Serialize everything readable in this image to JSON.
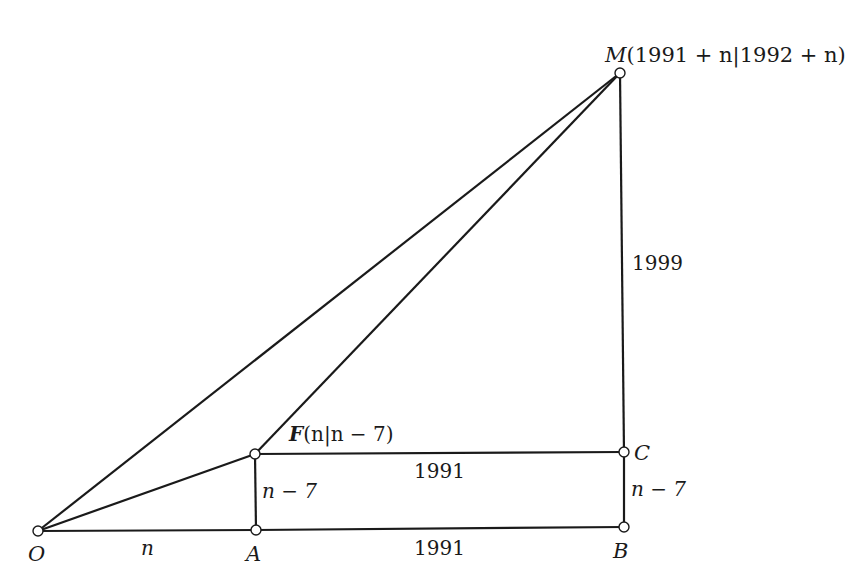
{
  "diagram": {
    "type": "geometry-figure",
    "points": {
      "O": {
        "label": "O",
        "x": 38,
        "y": 531
      },
      "A": {
        "label": "A",
        "x": 256,
        "y": 530
      },
      "B": {
        "label": "B",
        "x": 624,
        "y": 527
      },
      "C": {
        "label": "C",
        "x": 624,
        "y": 452
      },
      "F": {
        "label": "F",
        "coord_text": "(n|n − 7)",
        "x": 255,
        "y": 454
      },
      "M": {
        "label": "M",
        "coord_text": "(1991 + n|1992 + n)",
        "x": 620,
        "y": 73
      }
    },
    "segment_labels": {
      "OA": "n",
      "AB": "1991",
      "FC": "1991",
      "AF": "n − 7",
      "BC": "n − 7",
      "CM": "1999"
    },
    "segments": [
      [
        "O",
        "A"
      ],
      [
        "A",
        "B"
      ],
      [
        "B",
        "C"
      ],
      [
        "C",
        "M"
      ],
      [
        "O",
        "M"
      ],
      [
        "F",
        "M"
      ],
      [
        "O",
        "F"
      ],
      [
        "F",
        "C"
      ],
      [
        "A",
        "F"
      ]
    ],
    "colors": {
      "stroke": "#1a1a1a",
      "point_fill": "#ffffff",
      "background": "#ffffff"
    }
  }
}
